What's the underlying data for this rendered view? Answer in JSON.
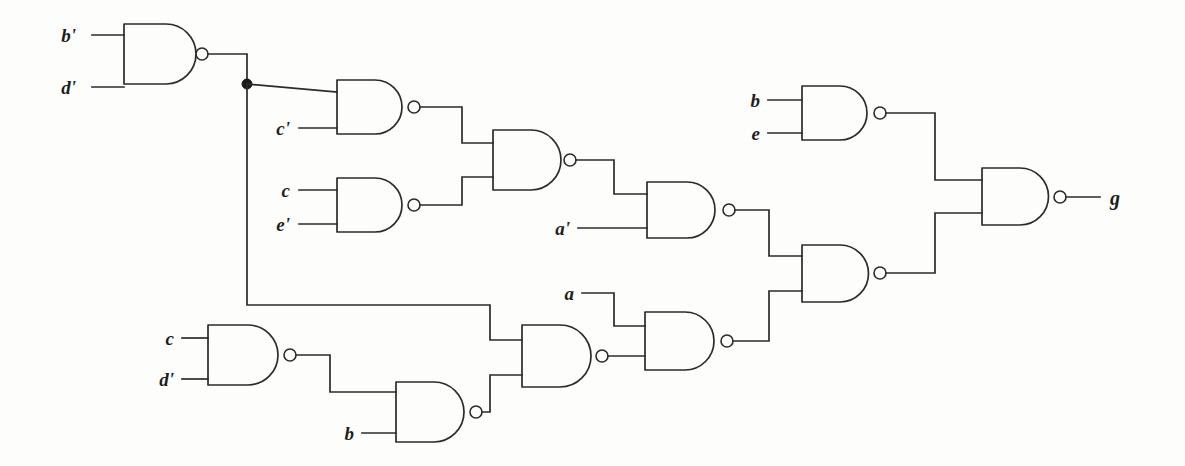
{
  "figure": {
    "kind": "logic-circuit-diagram",
    "background_color": "#fdfdfb",
    "line_color": "#2b2b2b",
    "gate_type": "NAND"
  },
  "inputs": [
    {
      "id": "in-b-prime-1",
      "label": "b'",
      "x": 76,
      "y": 35,
      "wire_x1": 92,
      "wire_x2": 124
    },
    {
      "id": "in-d-prime-1",
      "label": "d'",
      "x": 76,
      "y": 87,
      "wire_x1": 92,
      "wire_x2": 124
    },
    {
      "id": "in-c-prime",
      "label": "c'",
      "x": 281,
      "y": 130,
      "wire_x1": 299,
      "wire_x2": 337
    },
    {
      "id": "in-c-1",
      "label": "c",
      "x": 283,
      "y": 194,
      "wire_x1": 299,
      "wire_x2": 337
    },
    {
      "id": "in-e-prime",
      "label": "e'",
      "x": 281,
      "y": 228,
      "wire_x1": 299,
      "wire_x2": 337
    },
    {
      "id": "in-a-prime",
      "label": "a'",
      "x": 560,
      "y": 231,
      "wire_x1": 578,
      "wire_x2": 647
    },
    {
      "id": "in-a",
      "label": "a",
      "x": 566,
      "y": 297,
      "wire_x1": 582,
      "wire_x2": 628
    },
    {
      "id": "in-b-top",
      "label": "b",
      "x": 752,
      "y": 103,
      "wire_x1": 768,
      "wire_x2": 802
    },
    {
      "id": "in-e",
      "label": "e",
      "x": 752,
      "y": 137,
      "wire_x1": 768,
      "wire_x2": 802
    },
    {
      "id": "in-c-2",
      "label": "c",
      "x": 166,
      "y": 342,
      "wire_x1": 182,
      "wire_x2": 208
    },
    {
      "id": "in-d-prime-2",
      "label": "d'",
      "x": 164,
      "y": 383,
      "wire_x1": 182,
      "wire_x2": 208
    },
    {
      "id": "in-b-bottom",
      "label": "b",
      "x": 346,
      "y": 437,
      "wire_x1": 362,
      "wire_x2": 396
    }
  ],
  "output": {
    "id": "out-g",
    "label": "g",
    "x": 1112,
    "y": 203,
    "wire_x1": 1072,
    "wire_x2": 1100
  },
  "gates": [
    {
      "id": "gate-bd",
      "name": "nand-b-prime-d-prime",
      "x": 124,
      "y": 24,
      "w": 76,
      "h": 60
    },
    {
      "id": "gate-cprime",
      "name": "nand-c-prime",
      "x": 337,
      "y": 80,
      "w": 75,
      "h": 54
    },
    {
      "id": "gate-ce",
      "name": "nand-c-e-prime",
      "x": 337,
      "y": 178,
      "w": 75,
      "h": 54
    },
    {
      "id": "gate-merge-top",
      "name": "nand-merge-upper",
      "x": 493,
      "y": 130,
      "w": 75,
      "h": 60
    },
    {
      "id": "gate-aprime",
      "name": "nand-a-prime",
      "x": 647,
      "y": 182,
      "w": 80,
      "h": 56
    },
    {
      "id": "gate-be",
      "name": "nand-b-e",
      "x": 802,
      "y": 86,
      "w": 76,
      "h": 54
    },
    {
      "id": "gate-prefinal",
      "name": "nand-prefinal",
      "x": 802,
      "y": 245,
      "w": 76,
      "h": 57
    },
    {
      "id": "gate-final",
      "name": "nand-output-g",
      "x": 982,
      "y": 168,
      "w": 76,
      "h": 57
    },
    {
      "id": "gate-cd",
      "name": "nand-c-d-prime",
      "x": 208,
      "y": 325,
      "w": 77,
      "h": 60
    },
    {
      "id": "gate-b",
      "name": "nand-b",
      "x": 396,
      "y": 382,
      "w": 75,
      "h": 60
    },
    {
      "id": "gate-merge-bot",
      "name": "nand-merge-lower",
      "x": 522,
      "y": 325,
      "w": 75,
      "h": 62
    },
    {
      "id": "gate-a",
      "name": "nand-a",
      "x": 645,
      "y": 312,
      "w": 80,
      "h": 58
    }
  ],
  "junctions": [
    {
      "id": "junction-bd-fanout",
      "x": 247,
      "y": 84,
      "r": 5
    }
  ],
  "nets": [
    {
      "id": "net-bd-out",
      "from": "gate-bd",
      "to": "gate-c-prime-input / lower-branch"
    },
    {
      "id": "net-cprime-out",
      "from": "gate-cprime",
      "to": "gate-merge-top"
    },
    {
      "id": "net-ce-out",
      "from": "gate-ce",
      "to": "gate-merge-top"
    },
    {
      "id": "net-merge-top-out",
      "from": "gate-merge-top",
      "to": "gate-aprime"
    },
    {
      "id": "net-aprime-out",
      "from": "gate-aprime",
      "to": "gate-prefinal"
    },
    {
      "id": "net-be-out",
      "from": "gate-be",
      "to": "gate-final"
    },
    {
      "id": "net-prefinal-out",
      "from": "gate-prefinal",
      "to": "gate-final"
    },
    {
      "id": "net-cd-out",
      "from": "gate-cd",
      "to": "gate-b"
    },
    {
      "id": "net-b-out",
      "from": "gate-b",
      "to": "gate-merge-bot"
    },
    {
      "id": "net-merge-bot-out",
      "from": "gate-merge-bot",
      "to": "gate-a"
    },
    {
      "id": "net-a-out",
      "from": "gate-a",
      "to": "gate-prefinal"
    }
  ]
}
